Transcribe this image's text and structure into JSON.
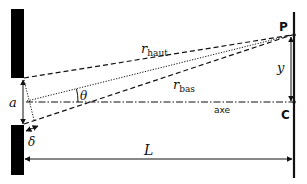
{
  "diagram": {
    "labels": {
      "P": "P",
      "C": "C",
      "y": "y",
      "r_haut": "r",
      "r_haut_sub": "haut",
      "r_bas": "r",
      "r_bas_sub": "bas",
      "theta": "θ",
      "a": "a",
      "delta": "δ",
      "L": "L",
      "axe": "axe"
    },
    "colors": {
      "line": "#111111",
      "background": "#ffffff",
      "wall": "#000000"
    }
  }
}
